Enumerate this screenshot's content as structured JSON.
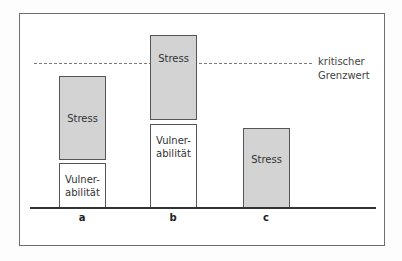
{
  "diagram": {
    "threshold_label_line1": "kritischer",
    "threshold_label_line2": "Grenzwert",
    "bars": [
      {
        "category": "a",
        "stress_label": "Stress",
        "vuln_label_1": "Vulner-",
        "vuln_label_2": "abilität"
      },
      {
        "category": "b",
        "stress_label": "Stress",
        "vuln_label_1": "Vulner-",
        "vuln_label_2": "abilität"
      },
      {
        "category": "c",
        "stress_label": "Stress"
      }
    ]
  },
  "colors": {
    "stress_fill": "#d3d3d3",
    "vulnerability_fill": "#ffffff",
    "frame": "#6e6e6e"
  }
}
